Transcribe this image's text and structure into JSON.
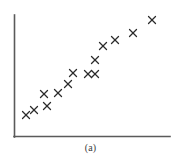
{
  "figure": {
    "caption": "(a)",
    "background_color": "#ffffff",
    "axis_color": "#5a5a5a",
    "marker_color": "#2b2b2b",
    "marker_symbol": "x",
    "marker_size_px": 7,
    "width_px": 181,
    "height_px": 165
  },
  "axes": {
    "y_axis": {
      "x": 14,
      "y_top": 15,
      "y_bottom": 137
    },
    "x_axis": {
      "y": 137,
      "x_left": 14,
      "x_right": 170
    },
    "has_ticks": false,
    "has_tick_labels": false,
    "has_gridlines": false,
    "x_axis_label": "",
    "y_axis_label": ""
  },
  "chart_data": {
    "type": "scatter",
    "title": "",
    "subtitle": "",
    "xlabel": "",
    "ylabel": "",
    "annotations": [
      "(a)"
    ],
    "legend": [],
    "legend_position": "none",
    "grid": false,
    "xlim": [
      0,
      100
    ],
    "ylim": [
      0,
      100
    ],
    "series": [
      {
        "name": "points",
        "marker": "x",
        "color": "#2b2b2b",
        "x": [
          8,
          13,
          19,
          21,
          28,
          35,
          38,
          47,
          52,
          52,
          57,
          65,
          76,
          89
        ],
        "y": [
          18,
          22,
          35,
          25,
          35,
          43,
          52,
          51,
          63,
          51,
          74,
          79,
          85,
          96
        ],
        "pixels": [
          {
            "x": 26,
            "y": 115
          },
          {
            "x": 34,
            "y": 110
          },
          {
            "x": 44,
            "y": 94
          },
          {
            "x": 47,
            "y": 106
          },
          {
            "x": 58,
            "y": 93
          },
          {
            "x": 68,
            "y": 84
          },
          {
            "x": 73,
            "y": 73
          },
          {
            "x": 88,
            "y": 74
          },
          {
            "x": 95,
            "y": 60
          },
          {
            "x": 95,
            "y": 74
          },
          {
            "x": 103,
            "y": 46
          },
          {
            "x": 115,
            "y": 40
          },
          {
            "x": 133,
            "y": 33
          },
          {
            "x": 152,
            "y": 20
          }
        ]
      }
    ],
    "point_count": 14,
    "relationship": "positive linear"
  }
}
